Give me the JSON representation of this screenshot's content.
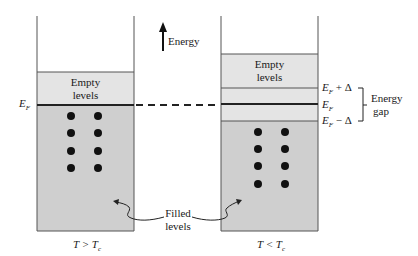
{
  "diagram": {
    "energy_axis_label": "Energy",
    "left_panel": {
      "condition": "T > T",
      "condition_sub": "c",
      "empty_label_line1": "Empty",
      "empty_label_line2": "levels",
      "fermi_label": "E",
      "fermi_sub": "F",
      "electron_dots": 8
    },
    "right_panel": {
      "condition": "T < T",
      "condition_sub": "c",
      "empty_label_line1": "Empty",
      "empty_label_line2": "levels",
      "upper_gap_label": "E",
      "upper_gap_sub": "F",
      "upper_gap_suffix": " + Δ",
      "fermi_label": "E",
      "fermi_sub": "F",
      "lower_gap_label": "E",
      "lower_gap_sub": "F",
      "lower_gap_suffix": " − Δ",
      "gap_label_line1": "Energy",
      "gap_label_line2": "gap",
      "electron_dots": 8
    },
    "filled_label_line1": "Filled",
    "filled_label_line2": "levels",
    "colors": {
      "empty_fill": "#e4e4e4",
      "filled_fill": "#cfcfcf",
      "outline": "#555555",
      "fermi_line": "#222222",
      "dot": "#111111"
    }
  }
}
